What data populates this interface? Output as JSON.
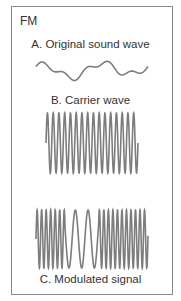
{
  "diagram": {
    "title": "FM",
    "panels": [
      {
        "label": "A. Original sound wave",
        "kind": "modulating-signal"
      },
      {
        "label": "B. Carrier wave",
        "kind": "carrier",
        "cycles": 16
      },
      {
        "label": "C. Modulated signal",
        "kind": "fm-signal"
      }
    ],
    "colors": {
      "wave": "#7d7d7d",
      "border": "#8a8a8a",
      "text": "#333333"
    }
  }
}
